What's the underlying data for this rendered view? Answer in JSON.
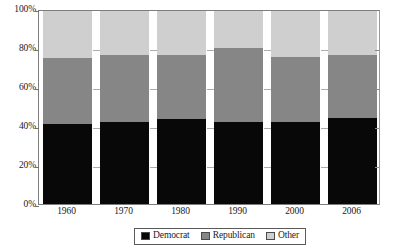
{
  "chart_data": {
    "type": "bar",
    "subtype": "stacked-100-percent",
    "title": "",
    "xlabel": "",
    "ylabel": "",
    "categories": [
      "1960",
      "1970",
      "1980",
      "1990",
      "2000",
      "2006"
    ],
    "series": [
      {
        "name": "Democrat",
        "color": "#080808",
        "values": [
          41.5,
          42.5,
          44.0,
          42.5,
          42.5,
          44.5
        ]
      },
      {
        "name": "Republican",
        "color": "#868686",
        "values": [
          34.0,
          34.5,
          33.0,
          38.5,
          33.5,
          32.5
        ]
      },
      {
        "name": "Other",
        "color": "#cfcfcf",
        "values": [
          24.5,
          23.0,
          23.0,
          19.0,
          24.0,
          23.0
        ]
      }
    ],
    "stack_order_bottom_to_top": [
      "Democrat",
      "Republican",
      "Other"
    ],
    "ylim": [
      0,
      100
    ],
    "yticks": [
      0,
      20,
      40,
      60,
      80,
      100
    ],
    "ytick_labels": [
      "0%",
      "20%",
      "40%",
      "60%",
      "80%",
      "100%"
    ],
    "grid": false,
    "legend_position": "bottom-center"
  },
  "axes": {
    "y_labels": [
      "100%",
      "80%",
      "60%",
      "40%",
      "20%",
      "0%"
    ],
    "x_labels": [
      "1960",
      "1970",
      "1980",
      "1990",
      "2000",
      "2006"
    ]
  },
  "legend": {
    "items": [
      {
        "label": "Democrat",
        "color": "#080808"
      },
      {
        "label": "Republican",
        "color": "#868686"
      },
      {
        "label": "Other",
        "color": "#cfcfcf"
      }
    ]
  }
}
